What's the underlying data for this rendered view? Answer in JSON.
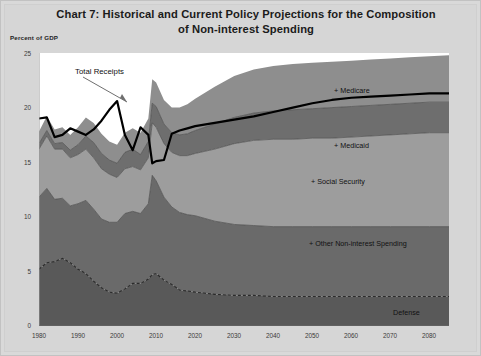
{
  "title": {
    "line1": "Chart 7:  Historical and Current Policy Projections  for the Composition",
    "line2": "of  Non-interest Spending"
  },
  "axes": {
    "y_title": "Percent of GDP",
    "y_ticks": [
      "0",
      "5",
      "10",
      "15",
      "20",
      "25"
    ],
    "x_ticks": [
      "1980",
      "1990",
      "2000",
      "2010",
      "2020",
      "2030",
      "2040",
      "2050",
      "2060",
      "2070",
      "2080"
    ]
  },
  "annotations": {
    "total_receipts": "Total Receipts"
  },
  "labels": {
    "medicare": "+ Medicare",
    "medicaid": "+ Medicaid",
    "social_security": "+ Social Security",
    "other": "+ Other Non-interest Spending",
    "defense": "Defense"
  },
  "colors": {
    "medicare_band": "#8e8e8e",
    "medicaid_band": "#6e6e6e",
    "social_security_band": "#9d9d9d",
    "other_band": "#6a6a6a",
    "defense_band": "#595959",
    "total_receipts_line": "#000000",
    "defense_line": "#2b2b2b",
    "plot_background": "#ffffff",
    "page_background": "#d6d6d6"
  },
  "chart_data": {
    "type": "area",
    "title": "Chart 7:  Historical and Current Policy Projections  for the Composition of  Non-interest Spending",
    "xlabel": "",
    "ylabel": "Percent of GDP",
    "xlim": [
      1980,
      2085
    ],
    "ylim": [
      0,
      25
    ],
    "grid": false,
    "legend": "in-plot right-side labels",
    "stacking": "cumulative: Defense, + Other Non-interest Spending, + Social Security, + Medicaid, + Medicare",
    "x": [
      1980,
      1982,
      1984,
      1986,
      1988,
      1990,
      1992,
      1994,
      1996,
      1998,
      2000,
      2002,
      2004,
      2006,
      2008,
      2009,
      2010,
      2012,
      2014,
      2016,
      2018,
      2020,
      2025,
      2030,
      2035,
      2040,
      2045,
      2050,
      2055,
      2060,
      2065,
      2070,
      2075,
      2080,
      2085
    ],
    "series": [
      {
        "name": "Defense",
        "note": "dashed line, bottom band",
        "values": [
          5.2,
          5.8,
          5.9,
          6.2,
          5.8,
          5.2,
          4.8,
          4.1,
          3.5,
          3.1,
          3.0,
          3.4,
          3.9,
          3.9,
          4.3,
          4.7,
          4.8,
          4.2,
          3.8,
          3.3,
          3.2,
          3.1,
          2.9,
          2.8,
          2.8,
          2.7,
          2.7,
          2.7,
          2.7,
          2.7,
          2.7,
          2.7,
          2.7,
          2.7,
          2.7
        ]
      },
      {
        "name": "+ Other Non-interest Spending",
        "note": "cumulative top of Defense + Other",
        "values": [
          11.8,
          12.6,
          11.6,
          11.7,
          11.0,
          11.2,
          11.5,
          10.7,
          9.8,
          9.5,
          9.5,
          10.3,
          10.5,
          10.3,
          11.2,
          13.8,
          13.3,
          11.8,
          10.9,
          10.4,
          10.2,
          10.1,
          9.6,
          9.3,
          9.2,
          9.1,
          9.1,
          9.1,
          9.1,
          9.1,
          9.1,
          9.1,
          9.1,
          9.1,
          9.1
        ]
      },
      {
        "name": "+ Social Security",
        "note": "cumulative",
        "values": [
          16.2,
          17.4,
          16.2,
          16.2,
          15.4,
          15.7,
          16.2,
          15.4,
          14.4,
          13.9,
          13.6,
          14.4,
          14.6,
          14.3,
          15.4,
          18.6,
          18.2,
          16.7,
          15.9,
          15.6,
          15.6,
          15.8,
          16.2,
          16.7,
          17.0,
          17.1,
          17.1,
          17.2,
          17.2,
          17.3,
          17.4,
          17.5,
          17.6,
          17.7,
          17.7
        ]
      },
      {
        "name": "+ Medicaid",
        "note": "cumulative",
        "values": [
          16.7,
          17.9,
          16.7,
          16.8,
          16.1,
          16.6,
          17.4,
          16.8,
          15.8,
          15.2,
          14.9,
          15.9,
          16.2,
          15.7,
          16.9,
          20.4,
          20.1,
          18.5,
          17.7,
          17.5,
          17.6,
          17.9,
          18.5,
          19.1,
          19.5,
          19.7,
          19.8,
          19.9,
          20.0,
          20.1,
          20.2,
          20.3,
          20.4,
          20.5,
          20.5
        ]
      },
      {
        "name": "+ Medicare",
        "note": "cumulative top of stack",
        "values": [
          17.8,
          19.2,
          18.0,
          18.2,
          17.5,
          18.2,
          19.1,
          18.6,
          17.6,
          16.9,
          16.6,
          17.7,
          18.1,
          17.7,
          19.0,
          22.6,
          22.3,
          20.7,
          20.0,
          20.0,
          20.3,
          20.8,
          21.9,
          22.9,
          23.5,
          23.8,
          24.0,
          24.1,
          24.2,
          24.3,
          24.4,
          24.5,
          24.6,
          24.7,
          24.8
        ]
      },
      {
        "name": "Total Receipts",
        "note": "heavy black overlay line",
        "values": [
          19.0,
          19.1,
          17.3,
          17.5,
          18.1,
          17.8,
          17.5,
          18.0,
          18.8,
          19.8,
          20.6,
          17.5,
          16.1,
          18.2,
          17.5,
          14.9,
          15.1,
          15.2,
          17.6,
          17.9,
          18.1,
          18.3,
          18.6,
          18.9,
          19.2,
          19.6,
          20.0,
          20.4,
          20.7,
          20.9,
          21.0,
          21.1,
          21.2,
          21.3,
          21.3
        ]
      }
    ]
  }
}
